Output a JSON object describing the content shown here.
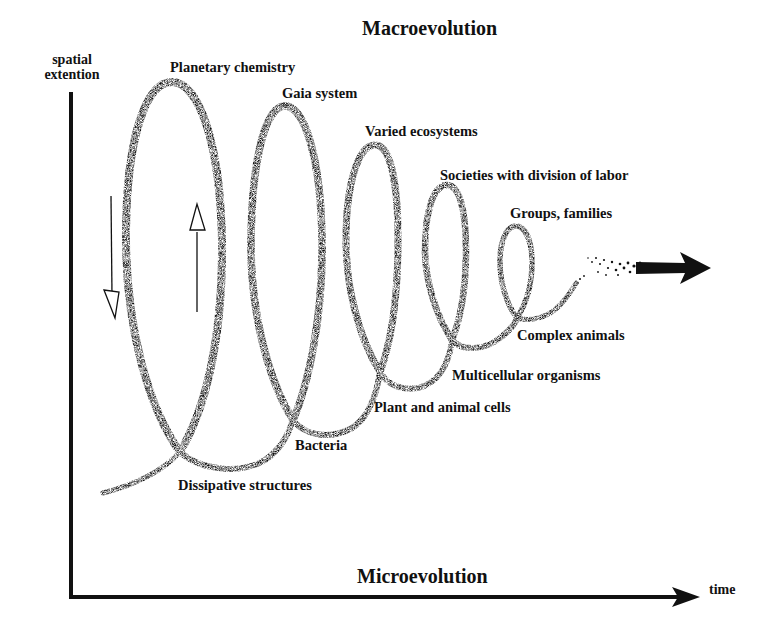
{
  "title_top": "Macroevolution",
  "title_bottom": "Microevolution",
  "axes": {
    "y_label_line1": "spatial",
    "y_label_line2": "extention",
    "x_label": "time"
  },
  "spiral_loops": [
    {
      "label": "Planetary chemistry",
      "crossing_label": "Dissipative structures"
    },
    {
      "label": "Gaia system",
      "crossing_label": "Bacteria"
    },
    {
      "label": "Varied ecosystems",
      "crossing_label": "Plant and animal cells"
    },
    {
      "label": "Societies with division of labor",
      "crossing_label": "Multicellular organisms"
    },
    {
      "label": "Groups, families",
      "crossing_label": "Complex animals"
    }
  ],
  "labels": {
    "planetary_chemistry": "Planetary chemistry",
    "gaia_system": "Gaia system",
    "varied_ecosystems": "Varied ecosystems",
    "societies": "Societies with division of labor",
    "groups_families": "Groups, families",
    "complex_animals": "Complex animals",
    "multicellular": "Multicellular organisms",
    "plant_animal_cells": "Plant and animal cells",
    "bacteria": "Bacteria",
    "dissipative": "Dissipative structures"
  },
  "colors": {
    "ink": "#111111",
    "background": "#ffffff"
  }
}
